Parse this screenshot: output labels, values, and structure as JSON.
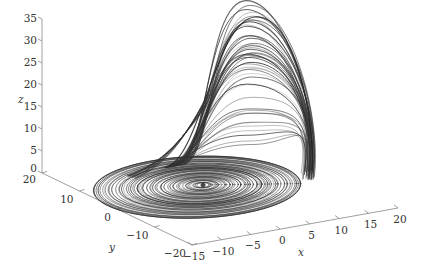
{
  "chart_data": {
    "type": "line",
    "subtype": "3d-trajectory",
    "title": "",
    "xlabel": "x",
    "ylabel": "y",
    "zlabel": "z",
    "xlim": [
      -15,
      20
    ],
    "ylim": [
      -20,
      20
    ],
    "zlim": [
      0,
      35
    ],
    "x_ticks": [
      "−15",
      "−10",
      "−5",
      "0",
      "5",
      "10",
      "15",
      "20"
    ],
    "y_ticks": [
      "−20",
      "−10",
      "0",
      "10",
      "20"
    ],
    "z_ticks": [
      "0",
      "5",
      "10",
      "15",
      "20",
      "25",
      "30",
      "35"
    ],
    "grid": false,
    "legend": null,
    "line_color": "#333333",
    "spiral_center": {
      "x": 0,
      "y": 0,
      "z": 0
    },
    "peak_z": 35
  },
  "axes": {
    "x_label": "x",
    "y_label": "y",
    "z_label": "z"
  }
}
